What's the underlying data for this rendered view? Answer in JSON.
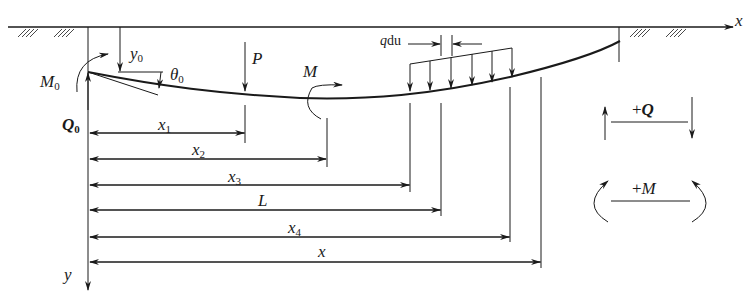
{
  "diagram": {
    "colors": {
      "line": "#1a1a1a",
      "background": "#ffffff"
    },
    "axes": {
      "x_label": "x",
      "y_label": "y"
    },
    "top_loads": {
      "deflection": {
        "base": "y",
        "sub": "0"
      },
      "rotation": {
        "base": "θ",
        "sub": "0"
      },
      "moment": {
        "base": "M",
        "sub": "0"
      },
      "shear": {
        "base": "Q",
        "sub": "0"
      }
    },
    "loads": {
      "point_force": "P",
      "moment": "M",
      "distributed": {
        "q": "q",
        "du": "du"
      }
    },
    "dimensions": [
      {
        "base": "x",
        "sub": "1"
      },
      {
        "base": "x",
        "sub": "2"
      },
      {
        "base": "x",
        "sub": "3"
      },
      {
        "base": "L",
        "sub": ""
      },
      {
        "base": "x",
        "sub": "4"
      },
      {
        "base": "x",
        "sub": ""
      }
    ],
    "sign_convention": {
      "shear": {
        "sign": "+",
        "symbol": "Q"
      },
      "moment": {
        "sign": "+",
        "symbol": "M"
      }
    }
  }
}
